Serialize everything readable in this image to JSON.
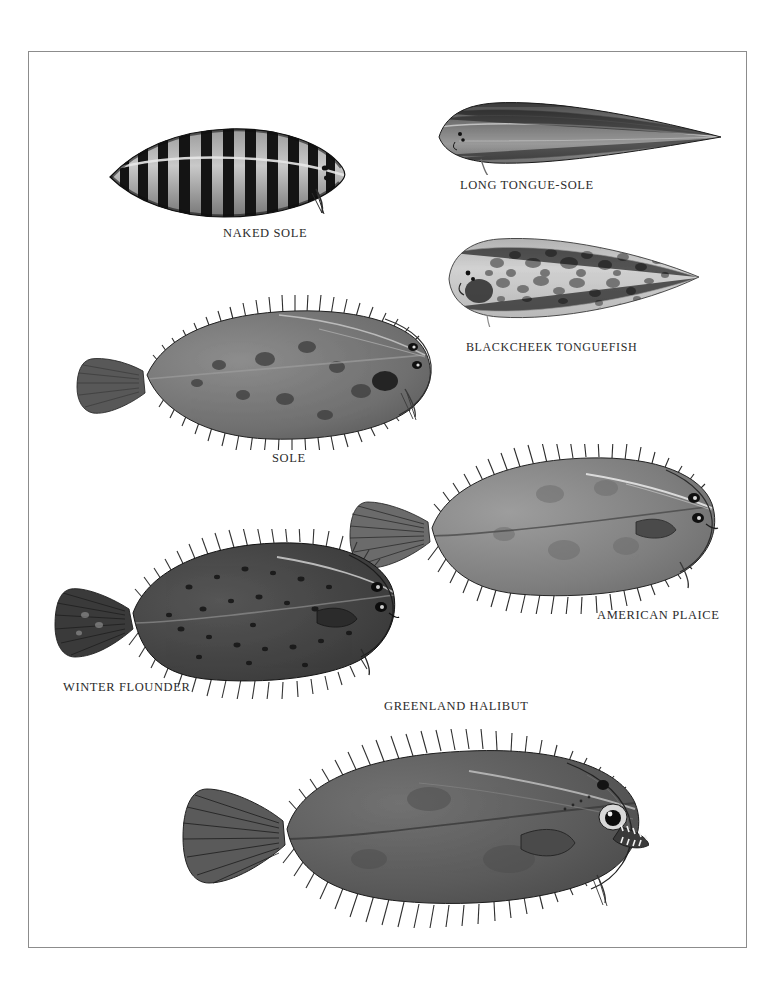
{
  "plate": {
    "title": "Flatfishes plate",
    "border_color": "#8c8c8c",
    "background": "#ffffff",
    "ink_color": "#2b2b2b"
  },
  "figures": [
    {
      "id": "naked-sole",
      "label": "NAKED SOLE",
      "label_x": 222,
      "label_y": 232,
      "fig_x": 105,
      "fig_y": 118,
      "fig_w": 240,
      "fig_h": 100,
      "pattern": "vertical-bars",
      "tone": "#1c1c1c",
      "head_side": "right"
    },
    {
      "id": "long-tongue-sole",
      "label": "LONG TONGUE-SOLE",
      "label_x": 459,
      "label_y": 177,
      "fig_x": 428,
      "fig_y": 96,
      "fig_w": 295,
      "fig_h": 72,
      "pattern": "smooth-lanceolate",
      "tone": "#5a5a5a",
      "head_side": "left"
    },
    {
      "id": "blackcheek-tonguefish",
      "label": "BLACKCHEEK TONGUEFISH",
      "label_x": 465,
      "label_y": 339,
      "fig_x": 440,
      "fig_y": 228,
      "fig_w": 260,
      "fig_h": 92,
      "pattern": "speckled",
      "tone": "#8e8e8e",
      "head_side": "left"
    },
    {
      "id": "sole",
      "label": "SOLE",
      "label_x": 274,
      "label_y": 458,
      "fig_x": 68,
      "fig_y": 294,
      "fig_w": 370,
      "fig_h": 148,
      "pattern": "mottled-fringed",
      "tone": "#5c5c5c",
      "head_side": "right"
    },
    {
      "id": "american-plaice",
      "label": "AMERICAN PLAICE",
      "label_x": 596,
      "label_y": 613,
      "fig_x": 335,
      "fig_y": 443,
      "fig_w": 375,
      "fig_h": 160,
      "pattern": "smooth-oval",
      "tone": "#666666",
      "head_side": "right"
    },
    {
      "id": "winter-flounder",
      "label": "WINTER FLOUNDER",
      "label_x": 62,
      "label_y": 686,
      "fig_x": 48,
      "fig_y": 528,
      "fig_w": 345,
      "fig_h": 160,
      "pattern": "dark-spotted",
      "tone": "#3a3a3a",
      "head_side": "right"
    },
    {
      "id": "greenland-halibut",
      "label": "GREENLAND HALIBUT",
      "label_x": 383,
      "label_y": 705,
      "fig_x": 168,
      "fig_y": 718,
      "fig_w": 470,
      "fig_h": 200,
      "pattern": "smooth-dark-toothed",
      "tone": "#4a4a4a",
      "head_side": "right"
    }
  ]
}
